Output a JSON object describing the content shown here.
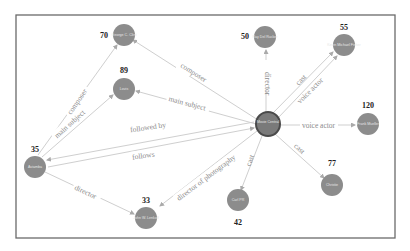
{
  "graph": {
    "nodes": [
      {
        "id": "center",
        "label": "Movie Central",
        "count": ""
      },
      {
        "id": "n70",
        "label": "George C. Clint",
        "count": "70"
      },
      {
        "id": "n89",
        "label": "Lovis",
        "count": "89"
      },
      {
        "id": "n50",
        "label": "Ray Del Rucker",
        "count": "50"
      },
      {
        "id": "n55",
        "label": "Kevin Michael Fisher",
        "count": "55"
      },
      {
        "id": "n120",
        "label": "Frank Mueller",
        "count": "120"
      },
      {
        "id": "n35",
        "label": "Aviamba",
        "count": "35"
      },
      {
        "id": "n33",
        "label": "John W. Lenkoff",
        "count": "33"
      },
      {
        "id": "n42",
        "label": "Carl PR",
        "count": "42"
      },
      {
        "id": "n77",
        "label": "Christie",
        "count": "77"
      }
    ],
    "edges": [
      {
        "from": "center",
        "to": "n70",
        "label": "composer"
      },
      {
        "from": "center",
        "to": "n89",
        "label": "main subject"
      },
      {
        "from": "center",
        "to": "n50",
        "label": "director"
      },
      {
        "from": "center",
        "to": "n55",
        "label": "cast"
      },
      {
        "from": "center",
        "to": "n55",
        "label": "voice actor"
      },
      {
        "from": "center",
        "to": "n120",
        "label": "voice actor"
      },
      {
        "from": "center",
        "to": "n42",
        "label": "cast"
      },
      {
        "from": "center",
        "to": "n77",
        "label": "cast"
      },
      {
        "from": "center",
        "to": "n33",
        "label": "director of photography"
      },
      {
        "from": "center",
        "to": "n35",
        "label": "followed by"
      },
      {
        "from": "n35",
        "to": "center",
        "label": "follows"
      },
      {
        "from": "n35",
        "to": "n70",
        "label": "composer"
      },
      {
        "from": "n35",
        "to": "n89",
        "label": "main subject"
      },
      {
        "from": "n35",
        "to": "n33",
        "label": "director"
      }
    ]
  }
}
